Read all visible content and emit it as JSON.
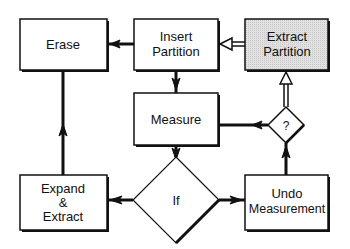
{
  "diagram": {
    "nodes": {
      "erase": {
        "label": "Erase",
        "shape": "box"
      },
      "insert": {
        "line1": "Insert",
        "line2": "Partition",
        "shape": "box"
      },
      "extract": {
        "line1": "Extract",
        "line2": "Partition",
        "shape": "box",
        "fill": "#d8d8d8"
      },
      "measure": {
        "label": "Measure",
        "shape": "box"
      },
      "question": {
        "label": "?",
        "shape": "diamond"
      },
      "expand": {
        "line1": "Expand",
        "line2": "&",
        "line3": "Extract",
        "shape": "box"
      },
      "if": {
        "label": "If",
        "shape": "diamond"
      },
      "undo": {
        "line1": "Undo",
        "line2": "Measurement",
        "shape": "box"
      }
    },
    "edges": [
      {
        "from": "insert",
        "to": "erase",
        "style": "solid"
      },
      {
        "from": "extract",
        "to": "insert",
        "style": "hollow"
      },
      {
        "from": "insert",
        "to": "measure",
        "style": "solid"
      },
      {
        "from": "question",
        "to": "measure",
        "style": "solid"
      },
      {
        "from": "question",
        "to": "extract",
        "style": "hollow"
      },
      {
        "from": "measure",
        "to": "if",
        "style": "solid"
      },
      {
        "from": "if",
        "to": "expand",
        "style": "solid"
      },
      {
        "from": "if",
        "to": "undo",
        "style": "solid"
      },
      {
        "from": "undo",
        "to": "question",
        "style": "solid"
      },
      {
        "from": "expand",
        "to": "erase",
        "style": "solid"
      }
    ],
    "colors": {
      "line": "#111111",
      "box_fill": "#ffffff",
      "highlight_fill": "#d8d8d8"
    }
  }
}
